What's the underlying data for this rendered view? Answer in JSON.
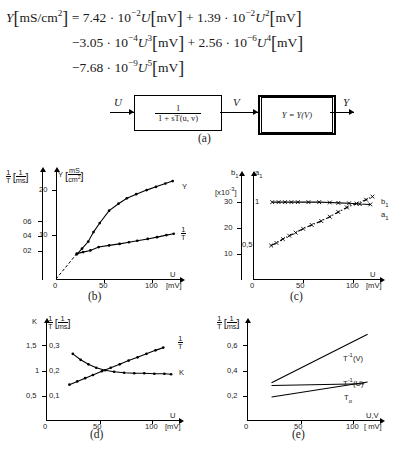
{
  "equation": {
    "line1": "Y[mS/cm2] = 7.42 · 10−2 U[mV] + 1.39 · 10−2 U2[mV]",
    "line2": "−3.05 · 10−4 U3[mV] + 2.56 · 10−6 U4[mV]",
    "line3": "−7.68 · 10−9 U5[mV]",
    "lhs_var": "Y",
    "lhs_unit": "mS/cm",
    "lhs_unit_exp": "2",
    "terms": [
      {
        "sign": "",
        "coeff": "7.42",
        "base": "10",
        "exp": "−2",
        "var": "U",
        "var_exp": "",
        "unit": "mV"
      },
      {
        "sign": "+",
        "coeff": "1.39",
        "base": "10",
        "exp": "−2",
        "var": "U",
        "var_exp": "2",
        "unit": "mV"
      },
      {
        "sign": "−",
        "coeff": "3.05",
        "base": "10",
        "exp": "−4",
        "var": "U",
        "var_exp": "3",
        "unit": "mV"
      },
      {
        "sign": "+",
        "coeff": "2.56",
        "base": "10",
        "exp": "−6",
        "var": "U",
        "var_exp": "4",
        "unit": "mV"
      },
      {
        "sign": "−",
        "coeff": "7.68",
        "base": "10",
        "exp": "−9",
        "var": "U",
        "var_exp": "5",
        "unit": "mV"
      }
    ]
  },
  "block_diagram": {
    "input_label": "U",
    "mid_label": "V",
    "output_label": "Y",
    "block1_numerator": "1",
    "block1_denominator": "1 + sT(u, v)",
    "block2_label": "Y = Y(V)",
    "caption": "(a)"
  },
  "captions": {
    "a": "(a)",
    "b": "(b)",
    "c": "(c)",
    "d": "(d)",
    "e": "(e)"
  },
  "chart_data": [
    {
      "id": "b",
      "type": "line",
      "caption": "(b)",
      "title": "",
      "xlabel": "U",
      "xunit": "[mV]",
      "xlim": [
        0,
        120
      ],
      "xticks": [
        0,
        50,
        100
      ],
      "xticklabels": [
        "0",
        "50",
        "100"
      ],
      "grid": false,
      "left_axis": {
        "label_num": "1",
        "label_den": "T",
        "unit_num": "1",
        "unit_den": "ms",
        "ticks": [
          0.2,
          0.4,
          0.6
        ],
        "ticklabels": [
          "02",
          "04",
          "06"
        ],
        "ylim": [
          0,
          0.78
        ]
      },
      "right_axis": {
        "label": "Y",
        "unit_num": "mS",
        "unit_den": "cm2",
        "ticks": [
          10,
          20
        ],
        "ticklabels": [
          "10",
          "20"
        ],
        "ylim": [
          0,
          26
        ]
      },
      "series": [
        {
          "name": "Y",
          "axis": "right",
          "marker": "dot",
          "style": "solid",
          "x": [
            20,
            25,
            31,
            36,
            42,
            51,
            60,
            68,
            77,
            87,
            96,
            105,
            112
          ],
          "y": [
            6.0,
            7.4,
            9.1,
            11.4,
            13.6,
            16.6,
            18.3,
            19.6,
            20.6,
            21.6,
            22.4,
            23.2,
            23.8
          ]
        },
        {
          "name": "1/T",
          "axis": "left",
          "marker": "dot",
          "style": "solid",
          "x": [
            20,
            26,
            33,
            41,
            51,
            61,
            70,
            78,
            88,
            97,
            106,
            113
          ],
          "y": [
            0.185,
            0.196,
            0.208,
            0.233,
            0.245,
            0.256,
            0.268,
            0.279,
            0.292,
            0.305,
            0.32,
            0.33
          ]
        }
      ]
    },
    {
      "id": "c",
      "type": "line",
      "caption": "(c)",
      "xlabel": "U",
      "xunit": "[mV]",
      "xlim": [
        0,
        120
      ],
      "xticks": [
        0,
        50,
        100
      ],
      "xticklabels": [
        "0",
        "50",
        "100"
      ],
      "scale_note": "[x10-3]",
      "left_axis": {
        "label": "b1",
        "ticks": [
          10,
          20,
          30
        ],
        "ticklabels": [
          "10",
          "20",
          "30"
        ],
        "ylim": [
          0,
          40
        ]
      },
      "right_axis": {
        "label": "a1",
        "ticks": [
          0.5,
          1.0
        ],
        "ticklabels": [
          "0,5",
          "1"
        ],
        "ylim": [
          0,
          1.34
        ]
      },
      "series": [
        {
          "name": "a1",
          "axis": "right",
          "marker": "cross",
          "style": "solid",
          "x": [
            18,
            24,
            30,
            36,
            42,
            52,
            62,
            72,
            80,
            90,
            100,
            110
          ],
          "y": [
            1.0,
            1.0,
            1.0,
            1.0,
            1.0,
            1.0,
            1.0,
            0.995,
            0.99,
            0.985,
            0.975,
            0.97
          ]
        },
        {
          "name": "b1",
          "axis": "left",
          "marker": "cross",
          "style": "dashdot",
          "x": [
            17,
            22,
            28,
            34,
            40,
            47,
            55,
            64,
            72,
            80,
            88,
            97,
            106,
            112
          ],
          "y": [
            13.0,
            14.0,
            15.5,
            16.8,
            18.0,
            19.5,
            21.0,
            22.5,
            24.2,
            26.0,
            27.8,
            29.3,
            30.8,
            32.0
          ]
        }
      ]
    },
    {
      "id": "d",
      "type": "line",
      "caption": "(d)",
      "xlabel": "U",
      "xunit": "[mV]",
      "xlim": [
        0,
        120
      ],
      "xticks": [
        0,
        50,
        100
      ],
      "xticklabels": [
        "0",
        "50",
        "100"
      ],
      "left_axis": {
        "label": "K",
        "ticks": [
          0.5,
          1.0,
          1.5
        ],
        "ticklabels": [
          "0,5",
          "1",
          "1,5"
        ],
        "ylim": [
          0,
          1.95
        ]
      },
      "right_axis": {
        "label_num": "1",
        "label_den": "T",
        "unit_num": "1",
        "unit_den": "ms",
        "ticks": [
          0.1,
          0.2,
          0.3
        ],
        "ticklabels": [
          "0,1",
          "0,2",
          "0,3"
        ],
        "ylim": [
          0,
          0.39
        ]
      },
      "series": [
        {
          "name": "1/T",
          "axis": "right",
          "marker": "dot",
          "style": "solid",
          "x": [
            21,
            28,
            35,
            42,
            50,
            58,
            66,
            74,
            82,
            90,
            98,
            105
          ],
          "y": [
            0.142,
            0.155,
            0.168,
            0.181,
            0.196,
            0.21,
            0.224,
            0.239,
            0.252,
            0.266,
            0.28,
            0.291
          ]
        },
        {
          "name": "K",
          "axis": "left",
          "marker": "dot",
          "style": "solid",
          "x": [
            24,
            31,
            38,
            45,
            53,
            61,
            70,
            79,
            88,
            97,
            106,
            112
          ],
          "y": [
            1.33,
            1.21,
            1.12,
            1.05,
            1.0,
            0.97,
            0.95,
            0.94,
            0.94,
            0.93,
            0.93,
            0.92
          ]
        }
      ]
    },
    {
      "id": "e",
      "type": "line",
      "caption": "(e)",
      "xlabel": "U,V",
      "xunit": "[ mV]",
      "xlim": [
        0,
        120
      ],
      "xticks": [
        0,
        50,
        100
      ],
      "xticklabels": [
        "0",
        "50",
        "100"
      ],
      "left_axis": {
        "label_num": "1",
        "label_den": "T",
        "unit_num": "1",
        "unit_den": "ms",
        "ticks": [
          0.2,
          0.4,
          0.6
        ],
        "ticklabels": [
          "0,2",
          "0,4",
          "0,6"
        ],
        "ylim": [
          0,
          0.78
        ]
      },
      "series": [
        {
          "name": "T-1(V)",
          "axis": "left",
          "marker": "none",
          "style": "solid",
          "x": [
            22,
            108
          ],
          "y": [
            0.3,
            0.69
          ]
        },
        {
          "name": "T-1(U)",
          "axis": "left",
          "marker": "none",
          "style": "solid",
          "x": [
            22,
            108
          ],
          "y": [
            0.185,
            0.305
          ]
        },
        {
          "name": "T0",
          "axis": "left",
          "marker": "none",
          "style": "solid",
          "x": [
            22,
            105
          ],
          "y": [
            0.277,
            0.292
          ]
        }
      ],
      "annotations": [
        "T−1(V)",
        "T−1(U)",
        "T₀"
      ]
    }
  ]
}
